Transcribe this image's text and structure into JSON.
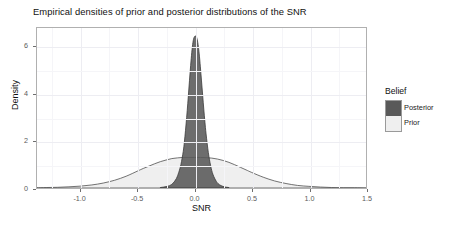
{
  "chart_data": {
    "type": "area",
    "title": "Empirical densities of prior and posterior distributions of the SNR",
    "xlabel": "SNR",
    "ylabel": "Density",
    "xlim": [
      -1.38,
      1.5
    ],
    "ylim": [
      0,
      6.8
    ],
    "grid": true,
    "legend": {
      "title": "Belief",
      "position": "right",
      "entries": [
        {
          "label": "Posterior",
          "color": "#595959"
        },
        {
          "label": "Prior",
          "color": "#efefef"
        }
      ]
    },
    "x_ticks": [
      {
        "value": -1.0,
        "label": "-1.0"
      },
      {
        "value": -0.5,
        "label": "-0.5"
      },
      {
        "value": 0.0,
        "label": "0.0"
      },
      {
        "value": 0.5,
        "label": "0.5"
      },
      {
        "value": 1.0,
        "label": "1.0"
      },
      {
        "value": 1.5,
        "label": "1.5"
      }
    ],
    "y_ticks": [
      {
        "value": 0,
        "label": "0"
      },
      {
        "value": 2,
        "label": "2"
      },
      {
        "value": 4,
        "label": "4"
      },
      {
        "value": 6,
        "label": "6"
      }
    ],
    "series": [
      {
        "name": "Prior",
        "fill": "#efefef",
        "line": "#4d4d4d",
        "peak_x": 0.0,
        "peak_y": 1.3,
        "x": [
          -1.38,
          -1.3,
          -1.2,
          -1.1,
          -1.0,
          -0.9,
          -0.8,
          -0.7,
          -0.6,
          -0.5,
          -0.45,
          -0.4,
          -0.35,
          -0.3,
          -0.25,
          -0.2,
          -0.15,
          -0.1,
          -0.05,
          0.0,
          0.05,
          0.1,
          0.15,
          0.2,
          0.25,
          0.3,
          0.35,
          0.4,
          0.45,
          0.5,
          0.6,
          0.7,
          0.8,
          0.9,
          1.0,
          1.1,
          1.2,
          1.3,
          1.4,
          1.5
        ],
        "y": [
          0.01,
          0.02,
          0.03,
          0.05,
          0.08,
          0.13,
          0.21,
          0.33,
          0.5,
          0.72,
          0.83,
          0.93,
          1.03,
          1.12,
          1.19,
          1.25,
          1.28,
          1.3,
          1.3,
          1.3,
          1.3,
          1.29,
          1.27,
          1.23,
          1.17,
          1.09,
          0.99,
          0.88,
          0.77,
          0.66,
          0.46,
          0.3,
          0.19,
          0.11,
          0.07,
          0.04,
          0.02,
          0.01,
          0.01,
          0.0
        ]
      },
      {
        "name": "Posterior",
        "fill": "#595959",
        "line": "#3a3a3a",
        "peak_x": 0.01,
        "peak_y": 6.45,
        "x": [
          -0.3,
          -0.26,
          -0.22,
          -0.19,
          -0.16,
          -0.14,
          -0.12,
          -0.1,
          -0.09,
          -0.08,
          -0.07,
          -0.06,
          -0.05,
          -0.04,
          -0.03,
          -0.02,
          -0.01,
          0.0,
          0.01,
          0.02,
          0.03,
          0.04,
          0.05,
          0.06,
          0.07,
          0.08,
          0.09,
          0.1,
          0.12,
          0.14,
          0.16,
          0.19,
          0.22,
          0.26,
          0.3
        ],
        "y": [
          0.02,
          0.05,
          0.1,
          0.2,
          0.4,
          0.65,
          1.0,
          1.55,
          1.95,
          2.45,
          3.0,
          3.6,
          4.25,
          4.9,
          5.5,
          6.0,
          6.32,
          6.44,
          6.45,
          6.36,
          6.1,
          5.7,
          5.15,
          4.55,
          3.95,
          3.35,
          2.8,
          2.3,
          1.5,
          0.95,
          0.58,
          0.28,
          0.13,
          0.05,
          0.02
        ]
      }
    ]
  }
}
